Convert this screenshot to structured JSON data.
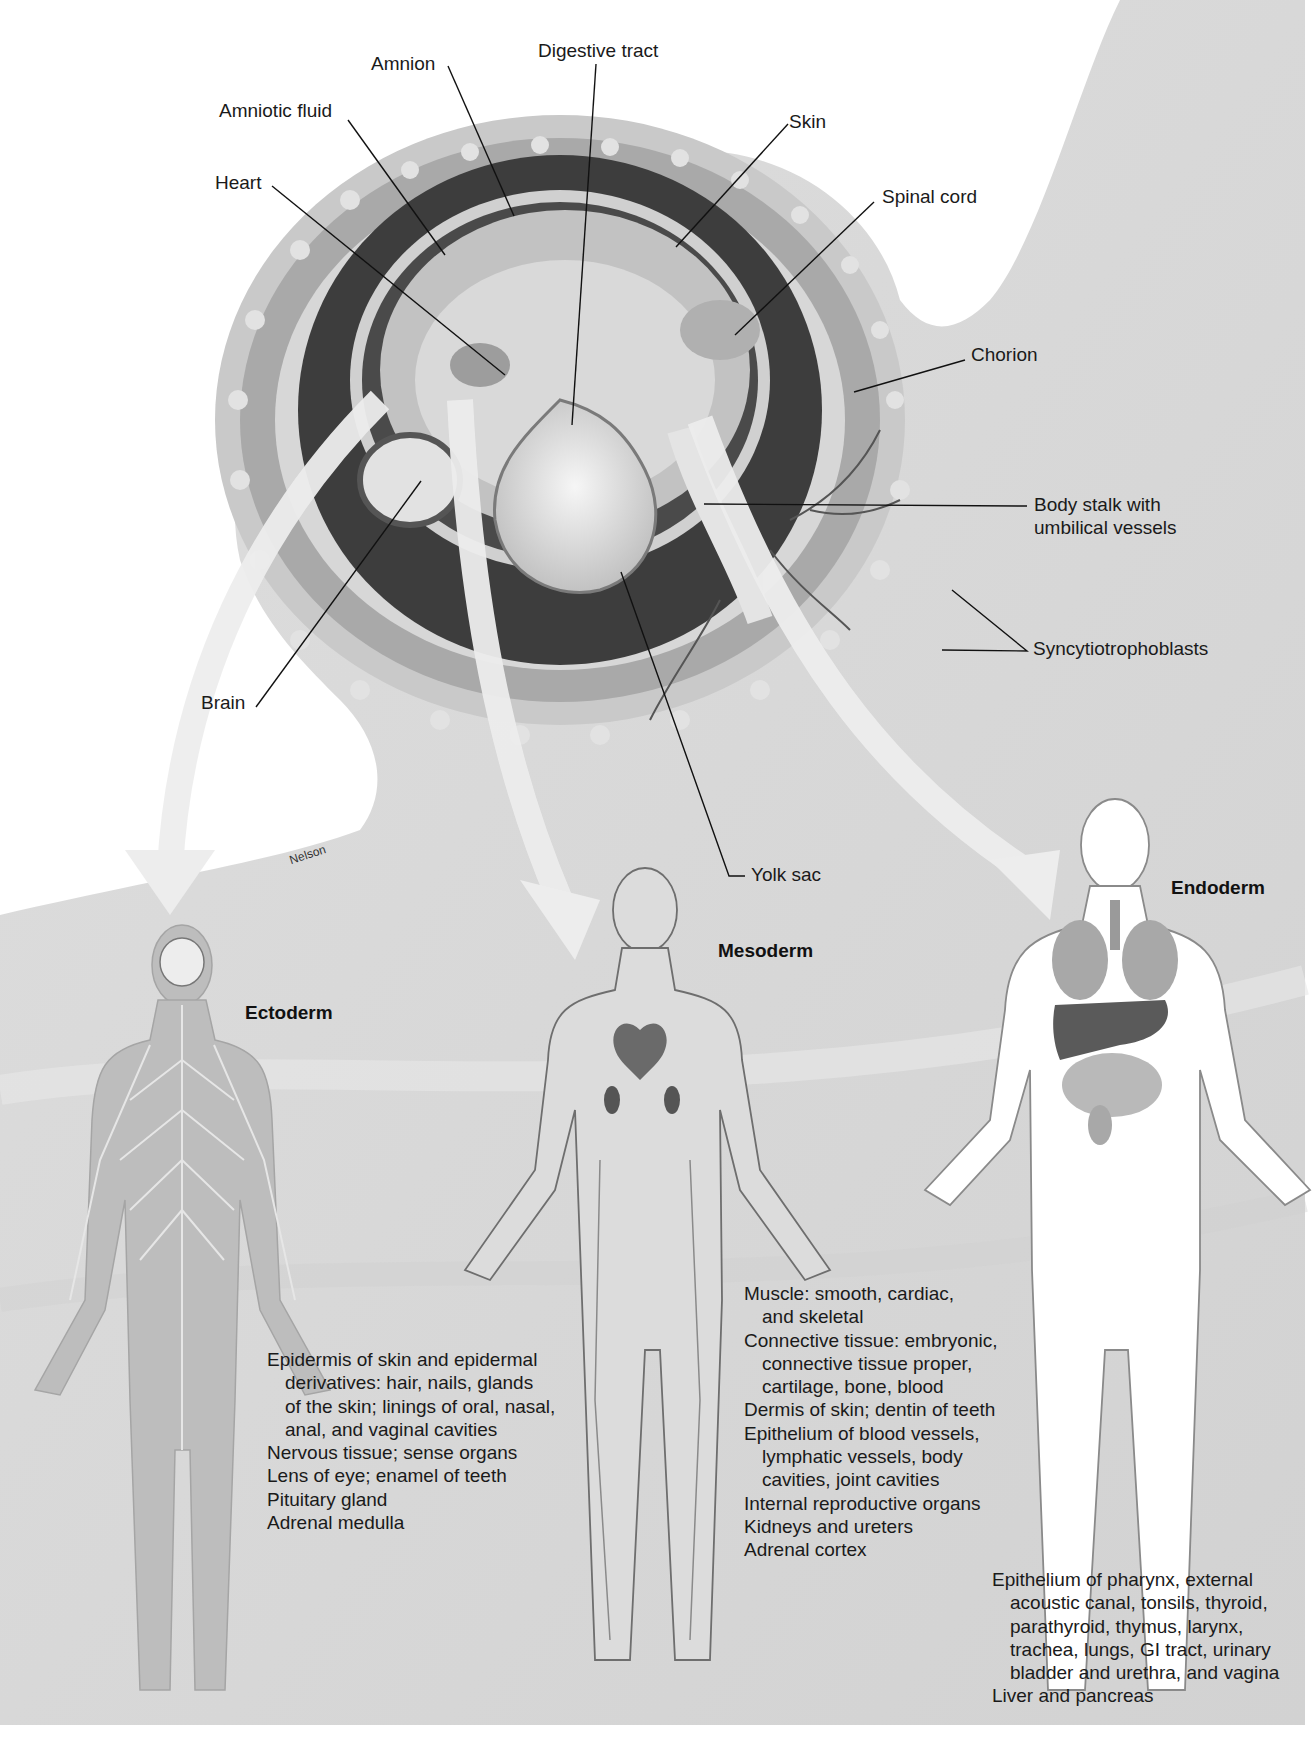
{
  "figure": {
    "artist_credit": "Nelson",
    "colors": {
      "page": "#ffffff",
      "uterine_wall": "#d9d9d9",
      "chorion_ring": "#bdbdbd",
      "amniotic_cavity_dark": "#3a3a3a",
      "embryo_tissue": "#cfcfcf",
      "yolk_sac": "#e6e6e6",
      "arrow": "#ededed",
      "ectoderm_figure": "#b8b8b8",
      "endoderm_figure": "#ffffff"
    }
  },
  "embryo_labels": [
    {
      "id": "amnion",
      "text": "Amnion"
    },
    {
      "id": "digestive-tract",
      "text": "Digestive tract"
    },
    {
      "id": "amniotic-fluid",
      "text": "Amniotic fluid"
    },
    {
      "id": "skin",
      "text": "Skin"
    },
    {
      "id": "heart",
      "text": "Heart"
    },
    {
      "id": "spinal-cord",
      "text": "Spinal cord"
    },
    {
      "id": "chorion",
      "text": "Chorion"
    },
    {
      "id": "body-stalk",
      "text": "Body stalk with"
    },
    {
      "id": "body-stalk-2",
      "text": "umbilical vessels"
    },
    {
      "id": "syncytiotrophoblasts",
      "text": "Syncytiotrophoblasts"
    },
    {
      "id": "brain",
      "text": "Brain"
    },
    {
      "id": "yolk-sac",
      "text": "Yolk sac"
    }
  ],
  "germ_layers": {
    "ectoderm": {
      "heading": "Ectoderm",
      "derivatives": [
        "Epidermis of skin and epidermal",
        "derivatives: hair, nails, glands",
        "of the skin; linings of oral, nasal,",
        "anal, and vaginal cavities",
        "Nervous tissue; sense organs",
        "Lens of eye; enamel of teeth",
        "Pituitary gland",
        "Adrenal medulla"
      ]
    },
    "mesoderm": {
      "heading": "Mesoderm",
      "derivatives": [
        "Muscle: smooth, cardiac,",
        "and skeletal",
        "Connective tissue: embryonic,",
        "connective tissue proper,",
        "cartilage, bone, blood",
        "Dermis of skin; dentin of teeth",
        "Epithelium of blood vessels,",
        "lymphatic vessels, body",
        "cavities, joint cavities",
        "Internal reproductive organs",
        "Kidneys and ureters",
        "Adrenal cortex"
      ]
    },
    "endoderm": {
      "heading": "Endoderm",
      "derivatives": [
        "Epithelium of pharynx, external",
        "acoustic canal, tonsils, thyroid,",
        "parathyroid, thymus, larynx,",
        "trachea, lungs, GI tract, urinary",
        "bladder and urethra, and vagina",
        "Liver and pancreas"
      ]
    }
  }
}
